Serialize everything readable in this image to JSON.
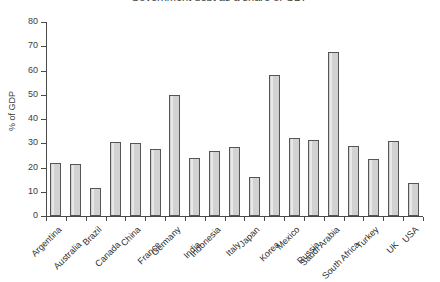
{
  "chart_data": {
    "type": "bar",
    "title": "Government debt as a share of GDP",
    "xlabel": "",
    "ylabel": "% of GDP",
    "ylim": [
      0,
      80
    ],
    "yticks": [
      0,
      10,
      20,
      30,
      40,
      50,
      60,
      70,
      80
    ],
    "grid": false,
    "legend": "none",
    "bar_color": "#d2d2d2",
    "bar_edge_color": "#555555",
    "axis_color": "#4a4a4a",
    "categories": [
      "Argentina",
      "Australia",
      "Brazil",
      "Canada",
      "China",
      "France",
      "Germany",
      "India",
      "Indonesia",
      "Italy",
      "Japan",
      "Korea",
      "Mexico",
      "Russia",
      "Saudi Arabia",
      "South Africa",
      "Turkey",
      "UK",
      "USA"
    ],
    "values": [
      22,
      21.5,
      11.5,
      30.5,
      30,
      27.5,
      50,
      24,
      27,
      28.5,
      16,
      58,
      32,
      31.5,
      67.5,
      29,
      23.5,
      31,
      13.5
    ]
  }
}
